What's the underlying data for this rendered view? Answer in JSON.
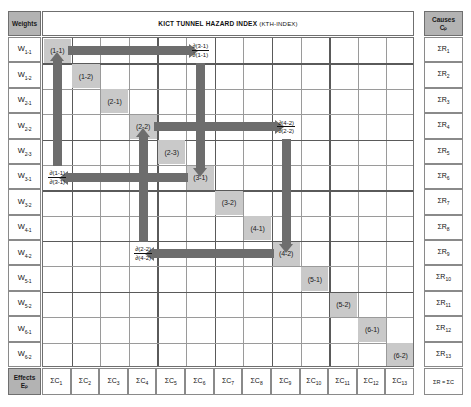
{
  "title": {
    "main": "KICT TUNNEL HAZARD INDEX",
    "paren": "(KTH-INDEX)"
  },
  "corners": {
    "weights_label": "Weights",
    "effects_label": "Effects",
    "effects_symbol": "Eₚ",
    "causes_label": "Causes",
    "causes_symbol": "Cₚ",
    "total_label": "ΣR = ΣC"
  },
  "weights": [
    {
      "base": "W",
      "sub": "1-1"
    },
    {
      "base": "W",
      "sub": "1-2"
    },
    {
      "base": "W",
      "sub": "2-1"
    },
    {
      "base": "W",
      "sub": "2-2"
    },
    {
      "base": "W",
      "sub": "2-3"
    },
    {
      "base": "W",
      "sub": "3-1"
    },
    {
      "base": "W",
      "sub": "3-2"
    },
    {
      "base": "W",
      "sub": "4-1"
    },
    {
      "base": "W",
      "sub": "4-2"
    },
    {
      "base": "W",
      "sub": "5-1"
    },
    {
      "base": "W",
      "sub": "5-2"
    },
    {
      "base": "W",
      "sub": "6-1"
    },
    {
      "base": "W",
      "sub": "6-2"
    }
  ],
  "causes": [
    {
      "base": "ΣR",
      "sub": "1"
    },
    {
      "base": "ΣR",
      "sub": "2"
    },
    {
      "base": "ΣR",
      "sub": "3"
    },
    {
      "base": "ΣR",
      "sub": "4"
    },
    {
      "base": "ΣR",
      "sub": "5"
    },
    {
      "base": "ΣR",
      "sub": "6"
    },
    {
      "base": "ΣR",
      "sub": "7"
    },
    {
      "base": "ΣR",
      "sub": "8"
    },
    {
      "base": "ΣR",
      "sub": "9"
    },
    {
      "base": "ΣR",
      "sub": "10"
    },
    {
      "base": "ΣR",
      "sub": "11"
    },
    {
      "base": "ΣR",
      "sub": "12"
    },
    {
      "base": "ΣR",
      "sub": "13"
    }
  ],
  "effects": [
    {
      "base": "ΣC",
      "sub": "1"
    },
    {
      "base": "ΣC",
      "sub": "2"
    },
    {
      "base": "ΣC",
      "sub": "3"
    },
    {
      "base": "ΣC",
      "sub": "4"
    },
    {
      "base": "ΣC",
      "sub": "5"
    },
    {
      "base": "ΣC",
      "sub": "6"
    },
    {
      "base": "ΣC",
      "sub": "7"
    },
    {
      "base": "ΣC",
      "sub": "8"
    },
    {
      "base": "ΣC",
      "sub": "9"
    },
    {
      "base": "ΣC",
      "sub": "10"
    },
    {
      "base": "ΣC",
      "sub": "11"
    },
    {
      "base": "ΣC",
      "sub": "12"
    },
    {
      "base": "ΣC",
      "sub": "13"
    }
  ],
  "diagonal_cells": [
    {
      "label": "(1-1)",
      "row": 0,
      "col": 0
    },
    {
      "label": "(1-2)",
      "row": 1,
      "col": 1
    },
    {
      "label": "(2-1)",
      "row": 2,
      "col": 2
    },
    {
      "label": "(2-2)",
      "row": 3,
      "col": 3
    },
    {
      "label": "(2-3)",
      "row": 4,
      "col": 4
    },
    {
      "label": "(3-1)",
      "row": 5,
      "col": 5
    },
    {
      "label": "(3-2)",
      "row": 6,
      "col": 6
    },
    {
      "label": "(4-1)",
      "row": 7,
      "col": 7
    },
    {
      "label": "(4-2)",
      "row": 8,
      "col": 8
    },
    {
      "label": "(5-1)",
      "row": 9,
      "col": 9
    },
    {
      "label": "(5-2)",
      "row": 10,
      "col": 10
    },
    {
      "label": "(6-1)",
      "row": 11,
      "col": 11
    },
    {
      "label": "(6-2)",
      "row": 12,
      "col": 12
    }
  ],
  "derivatives": [
    {
      "id": "d31_d11",
      "numerator": "∂(3-1)",
      "denominator": "∂(1-1)",
      "row": 0,
      "col": 5
    },
    {
      "id": "d42_d22",
      "numerator": "∂(4-2)",
      "denominator": "∂(2-2)",
      "row": 3,
      "col": 8
    },
    {
      "id": "d11_d31",
      "numerator": "∂(1-1)",
      "denominator": "∂(3-1)",
      "row": 5,
      "col": 0
    },
    {
      "id": "d22_d42",
      "numerator": "∂(2-2)",
      "denominator": "∂(4-2)",
      "row": 8,
      "col": 3
    }
  ],
  "arrows": [
    {
      "id": "arrow-right-1-1-to-3-1",
      "direction": "right"
    },
    {
      "id": "arrow-down-3-1-col",
      "direction": "down"
    },
    {
      "id": "arrow-left-3-1-to-1-1",
      "direction": "left"
    },
    {
      "id": "arrow-up-1-1-col",
      "direction": "up"
    },
    {
      "id": "arrow-right-2-2-to-4-2",
      "direction": "right"
    },
    {
      "id": "arrow-down-4-2-col",
      "direction": "down"
    },
    {
      "id": "arrow-left-4-2-to-2-2",
      "direction": "left"
    },
    {
      "id": "arrow-up-2-2-col",
      "direction": "up"
    }
  ],
  "colors": {
    "diagonal_fill": "#c9c9c9",
    "header_fill": "#b3b3b3",
    "arrow_fill": "#6d6d6d",
    "grid_line": "#9a9a9a",
    "grid_line_thick": "#5a5a5a",
    "background": "#ffffff"
  }
}
